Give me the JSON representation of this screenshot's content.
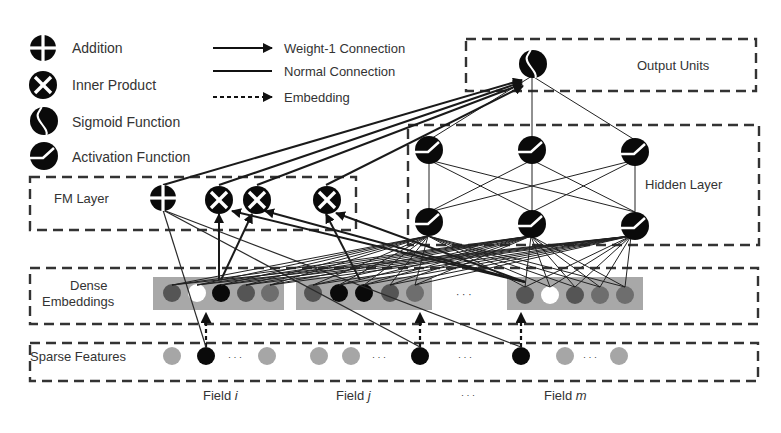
{
  "legend": {
    "nodes": [
      {
        "icon": "addition-icon",
        "label": "Addition"
      },
      {
        "icon": "inner-product-icon",
        "label": "Inner Product"
      },
      {
        "icon": "sigmoid-icon",
        "label": "Sigmoid Function"
      },
      {
        "icon": "activation-icon",
        "label": "Activation Function"
      }
    ],
    "connections": [
      {
        "style": "arrow-solid",
        "label": "Weight-1 Connection"
      },
      {
        "style": "line-solid",
        "label": "Normal Connection"
      },
      {
        "style": "arrow-dashed",
        "label": "Embedding"
      }
    ]
  },
  "layers": {
    "output": {
      "label": "Output Units"
    },
    "hidden": {
      "label": "Hidden Layer"
    },
    "fm": {
      "label": "FM Layer"
    },
    "dense": {
      "label_line1": "Dense",
      "label_line2": "Embeddings"
    },
    "sparse": {
      "label": "Sparse Features"
    }
  },
  "fields": [
    {
      "prefix": "Field ",
      "var": "i"
    },
    {
      "prefix": "Field ",
      "var": "j"
    },
    {
      "ellipsis": "· · ·"
    },
    {
      "prefix": "Field ",
      "var": "m"
    }
  ],
  "ellipsis": "· · ·",
  "colors": {
    "node_black": "#0a0a0a",
    "embedding_bar": "#a8a8a8",
    "emb_dark": "#555555",
    "emb_mid": "#6e6e6e",
    "emb_white": "#ffffff",
    "sparse_inactive": "#a6a6a6",
    "sparse_active": "#0a0a0a",
    "border": "#333333"
  }
}
